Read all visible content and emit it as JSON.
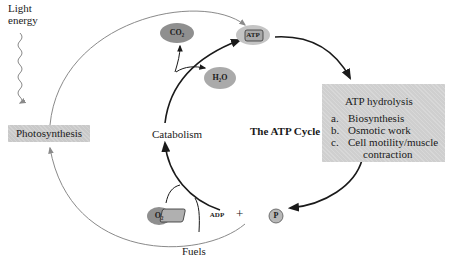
{
  "diagram": {
    "title": "The ATP Cycle",
    "inputs": {
      "light_energy": "Light\nenergy",
      "photosynthesis": "Photosynthesis",
      "fuels": "Fuels",
      "o2": "O₂"
    },
    "catabolism": {
      "label": "Catabolism",
      "products": [
        "CO₂",
        "H₂O"
      ]
    },
    "atp": "ATP",
    "adp": "ADP",
    "plus": "+",
    "phosphate": "P",
    "hydrolysis_box": {
      "heading": "ATP hydrolysis",
      "items": [
        {
          "key": "a.",
          "label": "Biosynthesis"
        },
        {
          "key": "b.",
          "label": "Osmotic work"
        },
        {
          "key": "c.",
          "label": "Cell motility/muscle"
        }
      ],
      "continuation": "contraction"
    },
    "colors": {
      "arrow_main": "#1a1a1a",
      "arrow_outer": "#8a8a8a",
      "box_fill": "#cfcfcf",
      "molecule_fill": "#9a9a9a"
    }
  }
}
